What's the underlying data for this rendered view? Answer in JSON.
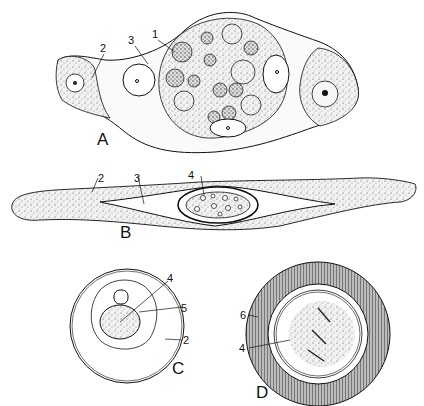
{
  "figure": {
    "panels": [
      {
        "id": "A",
        "label": "A",
        "callouts": [
          "1",
          "2",
          "3"
        ]
      },
      {
        "id": "B",
        "label": "B",
        "callouts": [
          "2",
          "3",
          "4"
        ]
      },
      {
        "id": "C",
        "label": "C",
        "callouts": [
          "4",
          "5",
          "2"
        ]
      },
      {
        "id": "D",
        "label": "D",
        "callouts": [
          "6",
          "4"
        ]
      }
    ]
  },
  "colors": {
    "ink": "#111111",
    "paper": "#ffffff",
    "stipple": "#e6e6e6"
  }
}
